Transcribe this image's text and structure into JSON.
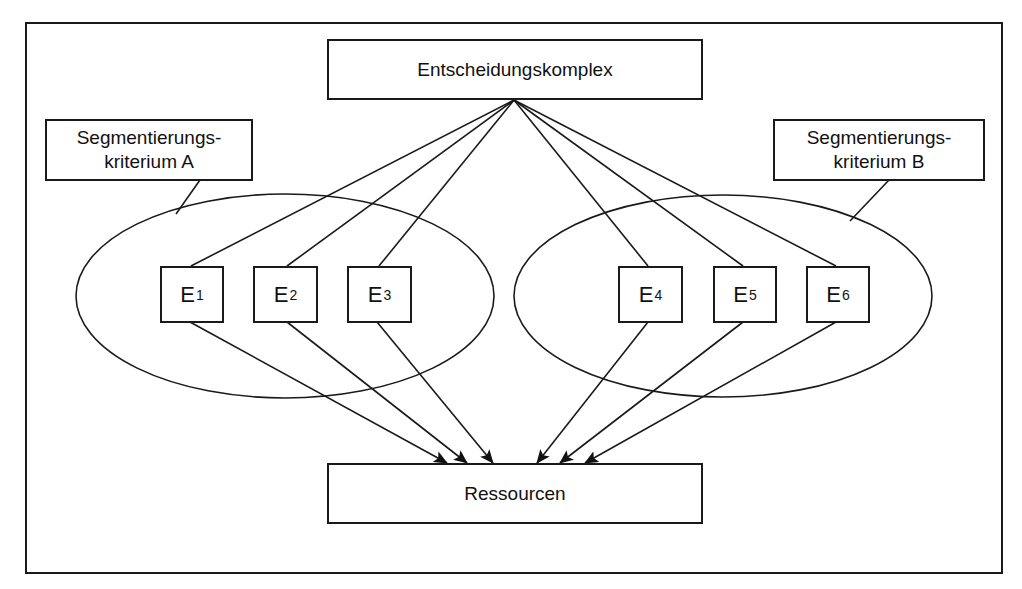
{
  "diagram": {
    "top_node": {
      "label": "Entscheidungskomplex"
    },
    "bottom_node": {
      "label": "Ressourcen"
    },
    "criterion_a": {
      "line1": "Segmentierungs-",
      "line2": "kriterium A"
    },
    "criterion_b": {
      "line1": "Segmentierungs-",
      "line2": "kriterium B"
    },
    "segments": [
      {
        "letter": "E",
        "index": "1",
        "group": "A"
      },
      {
        "letter": "E",
        "index": "2",
        "group": "A"
      },
      {
        "letter": "E",
        "index": "3",
        "group": "A"
      },
      {
        "letter": "E",
        "index": "4",
        "group": "B"
      },
      {
        "letter": "E",
        "index": "5",
        "group": "B"
      },
      {
        "letter": "E",
        "index": "6",
        "group": "B"
      }
    ],
    "edges": {
      "from_top_to_segments": [
        "E1",
        "E2",
        "E3",
        "E4",
        "E5",
        "E6"
      ],
      "from_segments_to_bottom": [
        "E1",
        "E2",
        "E3",
        "E4",
        "E5",
        "E6"
      ]
    },
    "colors": {
      "stroke": "#1a1a1a",
      "background": "#ffffff"
    }
  }
}
